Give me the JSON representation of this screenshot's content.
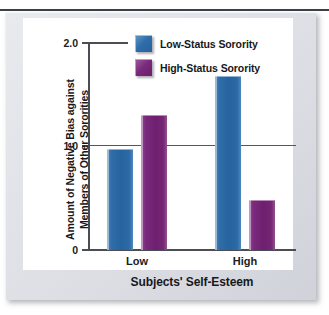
{
  "figure": {
    "top_rule_ghost_text": ""
  },
  "chart_data": {
    "type": "bar",
    "title": "",
    "xlabel": "Subjects' Self-Esteem",
    "ylabel": "Amount of Negative Bias against Members of Other Sororities",
    "ylabel_line1": "Amount of Negative Bias against",
    "ylabel_line2": "Members of Other Sororities",
    "categories": [
      "Low",
      "High"
    ],
    "ylim": [
      0,
      2.0
    ],
    "ytick_labels": [
      "2.0",
      "1.0",
      "0"
    ],
    "ytick_values": [
      2.0,
      1.0,
      0
    ],
    "grid": "horizontal-rule-at-1.0",
    "legend_position": "top-center",
    "series": [
      {
        "name": "Low-Status Sorority",
        "color": "#2F6DA8",
        "values": [
          0.97,
          1.67
        ]
      },
      {
        "name": "High-Status Sorority",
        "color": "#7A2A7C",
        "values": [
          1.3,
          0.48
        ]
      }
    ]
  }
}
